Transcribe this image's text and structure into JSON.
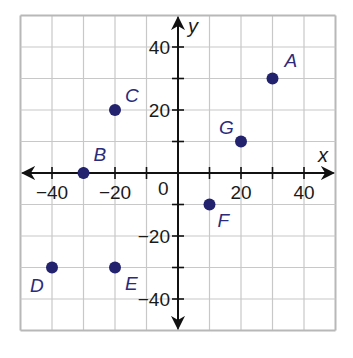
{
  "chart_data": {
    "type": "scatter",
    "title": "",
    "xlabel": "x",
    "ylabel": "y",
    "xlim": [
      -50,
      50
    ],
    "ylim": [
      -50,
      50
    ],
    "grid": true,
    "grid_step": 10,
    "x_tick_labels": [
      {
        "value": -40,
        "label": "−40"
      },
      {
        "value": -20,
        "label": "−20"
      },
      {
        "value": 20,
        "label": "20"
      },
      {
        "value": 40,
        "label": "40"
      }
    ],
    "y_tick_labels": [
      {
        "value": 40,
        "label": "40"
      },
      {
        "value": 20,
        "label": "20"
      },
      {
        "value": -20,
        "label": "−20"
      },
      {
        "value": -40,
        "label": "−40"
      }
    ],
    "origin_label": "0",
    "points": [
      {
        "name": "A",
        "x": 30,
        "y": 30,
        "label_dx": 12,
        "label_dy": -12
      },
      {
        "name": "B",
        "x": -30,
        "y": 0,
        "label_dx": 10,
        "label_dy": -12
      },
      {
        "name": "C",
        "x": -20,
        "y": 20,
        "label_dx": 10,
        "label_dy": -8
      },
      {
        "name": "D",
        "x": -40,
        "y": -30,
        "label_dx": -22,
        "label_dy": 24
      },
      {
        "name": "E",
        "x": -20,
        "y": -30,
        "label_dx": 10,
        "label_dy": 22
      },
      {
        "name": "F",
        "x": 10,
        "y": -10,
        "label_dx": 8,
        "label_dy": 22
      },
      {
        "name": "G",
        "x": 20,
        "y": 10,
        "label_dx": -22,
        "label_dy": -8
      }
    ],
    "colors": {
      "point": "#22226e",
      "grid": "#c8c8c8",
      "axis": "#111111",
      "border": "#b8b8b8"
    }
  },
  "axes": {
    "x_label": "x",
    "y_label": "y",
    "origin": "0"
  }
}
